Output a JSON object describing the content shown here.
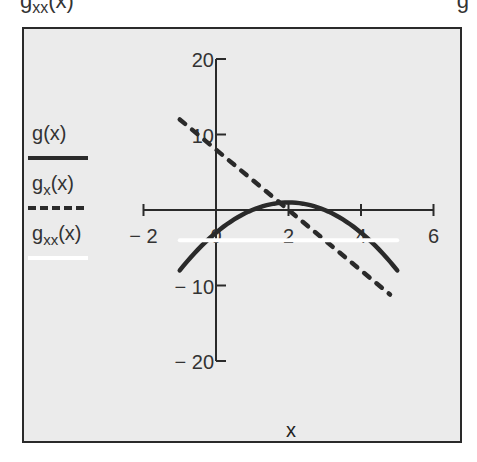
{
  "header": {
    "clipped_left_base": "g",
    "clipped_left_sub": "xx",
    "clipped_left_tail": "(x)",
    "clipped_right": "g"
  },
  "legend": [
    {
      "base": "g",
      "sub": "",
      "tail": "(x)",
      "style": "solid",
      "color": "#2a2a2a"
    },
    {
      "base": "g",
      "sub": "x",
      "tail": "(x)",
      "style": "dashed",
      "color": "#2a2a2a"
    },
    {
      "base": "g",
      "sub": "xx",
      "tail": "(x)",
      "style": "solid",
      "color": "#ffffff"
    }
  ],
  "axes": {
    "x_ticks": [
      "-2",
      "0",
      "2",
      "4",
      "6"
    ],
    "y_ticks": [
      "20",
      "10",
      "-10",
      "-20"
    ],
    "x_title": "x"
  },
  "chart_data": {
    "type": "line",
    "title": "",
    "xlabel": "x",
    "ylabel": "",
    "xlim": [
      -2,
      6
    ],
    "ylim": [
      -20,
      20
    ],
    "grid": false,
    "legend_position": "left",
    "x_ticks": [
      -2,
      0,
      2,
      4,
      6
    ],
    "y_ticks": [
      -20,
      -10,
      10,
      20
    ],
    "series": [
      {
        "name": "g(x)",
        "style": "solid",
        "color": "#2a2a2a",
        "x": [
          -1,
          0,
          1,
          2,
          3,
          4,
          5
        ],
        "values": [
          -8,
          -3,
          0,
          1,
          0,
          -3,
          -8
        ]
      },
      {
        "name": "g_x(x)",
        "style": "dashed",
        "color": "#2a2a2a",
        "x": [
          -1,
          0,
          1,
          2,
          3,
          4,
          4.8
        ],
        "values": [
          12,
          8,
          4,
          0,
          -4,
          -8,
          -11.2
        ]
      },
      {
        "name": "g_xx(x)",
        "style": "solid",
        "color": "#ffffff",
        "x": [
          -1,
          5
        ],
        "values": [
          -4,
          -4
        ]
      }
    ]
  }
}
